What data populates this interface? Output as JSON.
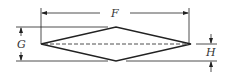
{
  "diagram": {
    "type": "rhombus-dimension-drawing",
    "labels": {
      "F": "F",
      "G": "G",
      "H": "H"
    },
    "colors": {
      "line": "#222222",
      "background": "#ffffff"
    }
  }
}
